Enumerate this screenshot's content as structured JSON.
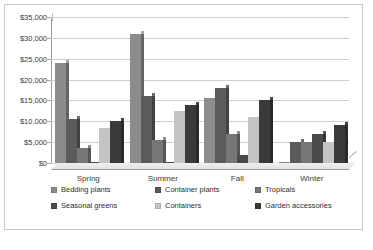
{
  "chart_data": {
    "type": "bar",
    "title": "",
    "xlabel": "",
    "ylabel": "",
    "categories": [
      "Spring",
      "Summer",
      "Fall",
      "Winter"
    ],
    "ylim": [
      0,
      35000
    ],
    "ytick_step": 5000,
    "ytick_labels": [
      "$0",
      "$5,000",
      "$10,000",
      "$15,000",
      "$20,000",
      "$25,000",
      "$30,000",
      "$35,000"
    ],
    "grid": true,
    "legend_position": "bottom",
    "style": "3d-column-grayscale",
    "series": [
      {
        "name": "Bedding plants",
        "color": "#8c8c8c",
        "values": [
          24000,
          31000,
          15500,
          200
        ]
      },
      {
        "name": "Container plants",
        "color": "#5b5b5b",
        "values": [
          10500,
          16000,
          18000,
          5000
        ]
      },
      {
        "name": "Tropicals",
        "color": "#777777",
        "values": [
          3500,
          5500,
          7000,
          5000
        ]
      },
      {
        "name": "Seasonal greens",
        "color": "#4a4a4a",
        "values": [
          300,
          250,
          2000,
          7000
        ]
      },
      {
        "name": "Containers",
        "color": "#c4c4c4",
        "values": [
          8500,
          12500,
          11000,
          5000
        ]
      },
      {
        "name": "Garden accessories",
        "color": "#3a3a3a",
        "values": [
          10000,
          14000,
          15000,
          9000
        ]
      }
    ]
  }
}
